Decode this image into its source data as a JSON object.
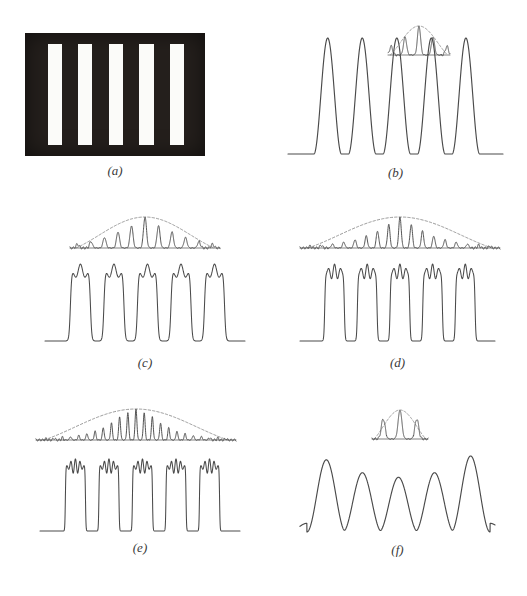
{
  "figure": {
    "background_color": "#ffffff",
    "ink_color": "#4a4a4a",
    "grating_dark_color": "#241f1c",
    "grating_light_color": "#fbfbf9",
    "label_color": "#3a3a3a",
    "dashed_envelope_color": "#8d8d8d"
  },
  "panels": [
    {
      "id": "a",
      "label": "(a)",
      "kind": "grating-photograph",
      "description": "Opaque screen with five clear vertical slits",
      "bars": 5,
      "x": 25,
      "y": 33,
      "w": 180,
      "h": 123,
      "slit_positions_pct": [
        12.5,
        29.5,
        46.5,
        63.5,
        80.5
      ],
      "slit_width_pct": 8.0,
      "slit_top_pct": 9.0,
      "slit_bottom_pct": 91.0,
      "label_x": 25,
      "label_y": 163,
      "label_w": 180
    },
    {
      "id": "b",
      "label": "(b)",
      "kind": "reconstructed-image",
      "description": "Image formed from the zero order plus first orders only - smooth sinusoidal fringes",
      "orders_kept": 3,
      "x": 288,
      "y": 30,
      "w": 215,
      "h": 130,
      "label_x": 288,
      "label_y": 165,
      "label_w": 215,
      "inset": {
        "x": 388,
        "y": 22,
        "w": 62,
        "h": 40,
        "orders": 5,
        "envelope": "dashed"
      }
    },
    {
      "id": "c",
      "label": "(c)",
      "kind": "reconstructed-image",
      "description": "Image formed with more diffraction orders - square pulses with two-lobe ringing",
      "orders_kept": 7,
      "x": 45,
      "y": 255,
      "w": 200,
      "h": 90,
      "label_x": 45,
      "label_y": 355,
      "label_w": 200,
      "inset": {
        "x": 70,
        "y": 213,
        "w": 150,
        "h": 42,
        "orders": 11,
        "envelope": "dashed"
      }
    },
    {
      "id": "d",
      "label": "(d)",
      "kind": "reconstructed-image",
      "description": "Image formed with still more orders - sharper square pulses, three-lobe ringing",
      "orders_kept": 11,
      "x": 300,
      "y": 255,
      "w": 195,
      "h": 90,
      "label_x": 300,
      "label_y": 355,
      "label_w": 195,
      "inset": {
        "x": 300,
        "y": 213,
        "w": 200,
        "h": 42,
        "orders": 17,
        "envelope": "dashed"
      }
    },
    {
      "id": "e",
      "label": "(e)",
      "kind": "reconstructed-image",
      "description": "Image formed with the largest set of orders - steepest edges, finest ringing",
      "orders_kept": 15,
      "x": 40,
      "y": 450,
      "w": 200,
      "h": 85,
      "label_x": 40,
      "label_y": 540,
      "label_w": 200,
      "inset": {
        "x": 36,
        "y": 405,
        "w": 200,
        "h": 42,
        "orders": 23,
        "envelope": "dashed"
      }
    },
    {
      "id": "f",
      "label": "(f)",
      "kind": "reconstructed-image",
      "description": "Image formed from an off-centre pair of orders - unequal smooth fringes with edge ripples",
      "orders_kept": 3,
      "x": 300,
      "y": 450,
      "w": 195,
      "h": 90,
      "label_x": 300,
      "label_y": 542,
      "label_w": 195,
      "inset": {
        "x": 372,
        "y": 406,
        "w": 56,
        "h": 40,
        "orders": 3,
        "envelope": "dashed"
      }
    }
  ],
  "chart_data": {
    "type": "line",
    "title": "",
    "xlabel": "",
    "ylabel": "",
    "grid": false,
    "legend": false,
    "panels": [
      {
        "id": "a",
        "kind": "object",
        "x": [
          0,
          0.09,
          0.09,
          0.17,
          0.17,
          0.26,
          0.26,
          0.34,
          0.34,
          0.43,
          0.43,
          0.51,
          0.51,
          0.6,
          0.6,
          0.68,
          0.68,
          0.77,
          0.77,
          0.85,
          0.85,
          1.0
        ],
        "values": [
          0,
          0,
          1,
          1,
          0,
          0,
          1,
          1,
          0,
          0,
          1,
          1,
          0,
          0,
          1,
          1,
          0,
          0,
          1,
          1,
          0,
          0
        ],
        "note": "binary transmittance of the five-slit grating"
      },
      {
        "id": "b",
        "kind": "image",
        "profile": "smooth",
        "peaks": 5,
        "peak_heights": [
          1.0,
          1.0,
          1.0,
          1.0,
          1.0
        ],
        "ripple_lobes_per_peak": 0,
        "baseline": 0.0,
        "ylim": [
          0,
          1.1
        ]
      },
      {
        "id": "c",
        "kind": "image",
        "profile": "square-with-ringing",
        "peaks": 5,
        "peak_heights": [
          1.0,
          1.0,
          1.0,
          1.0,
          1.0
        ],
        "ripple_lobes_per_peak": 2,
        "baseline": 0.0,
        "ylim": [
          0,
          1.15
        ]
      },
      {
        "id": "d",
        "kind": "image",
        "profile": "square-with-ringing",
        "peaks": 5,
        "peak_heights": [
          1.0,
          1.0,
          1.0,
          1.0,
          1.0
        ],
        "ripple_lobes_per_peak": 3,
        "baseline": 0.0,
        "ylim": [
          0,
          1.15
        ]
      },
      {
        "id": "e",
        "kind": "image",
        "profile": "square-with-ringing",
        "peaks": 5,
        "peak_heights": [
          1.0,
          1.0,
          1.0,
          1.0,
          1.0
        ],
        "ripple_lobes_per_peak": 4,
        "baseline": 0.0,
        "ylim": [
          0,
          1.15
        ]
      },
      {
        "id": "f",
        "kind": "image",
        "profile": "smooth-unequal",
        "peaks": 5,
        "peak_heights": [
          0.95,
          0.78,
          0.72,
          0.78,
          1.0
        ],
        "ripple_lobes_per_peak": 0,
        "edge_ripples": true,
        "baseline": 0.12,
        "ylim": [
          0,
          1.05
        ]
      }
    ],
    "insets": [
      {
        "panel": "b",
        "type": "spectrum",
        "orders": 5,
        "amplitudes": [
          0.3,
          0.62,
          1.0,
          0.62,
          0.3
        ],
        "envelope": "sinc",
        "width_rel": 0.29
      },
      {
        "panel": "c",
        "type": "spectrum",
        "orders": 11,
        "amplitudes": [
          0.12,
          0.2,
          0.34,
          0.52,
          0.72,
          1.0,
          0.72,
          0.52,
          0.34,
          0.2,
          0.12
        ],
        "envelope": "sinc",
        "width_rel": 0.7
      },
      {
        "panel": "d",
        "type": "spectrum",
        "orders": 17,
        "amplitudes": [
          0.06,
          0.09,
          0.13,
          0.19,
          0.27,
          0.39,
          0.55,
          0.76,
          1.0,
          0.76,
          0.55,
          0.39,
          0.27,
          0.19,
          0.13,
          0.09,
          0.06
        ],
        "envelope": "sinc",
        "width_rel": 0.93
      },
      {
        "panel": "e",
        "type": "spectrum",
        "orders": 23,
        "amplitudes": [
          0.04,
          0.06,
          0.08,
          0.11,
          0.15,
          0.21,
          0.29,
          0.4,
          0.55,
          0.75,
          0.88,
          1.0,
          0.88,
          0.75,
          0.55,
          0.4,
          0.29,
          0.21,
          0.15,
          0.11,
          0.08,
          0.06,
          0.04
        ],
        "envelope": "sinc",
        "width_rel": 1.0
      },
      {
        "panel": "f",
        "type": "spectrum",
        "orders": 3,
        "amplitudes": [
          0.7,
          1.0,
          0.7
        ],
        "envelope": "sinc",
        "width_rel": 0.26
      }
    ]
  }
}
